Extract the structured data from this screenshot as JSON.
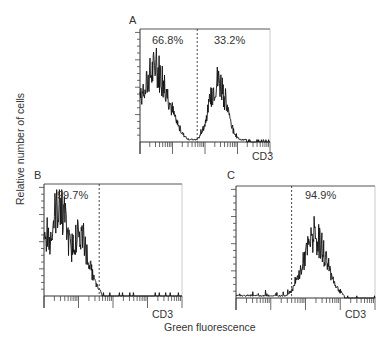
{
  "figure": {
    "y_axis_label": "Relative number of cells",
    "x_axis_label": "Green fluorescence"
  },
  "chart_data": [
    {
      "type": "area",
      "panel": "A",
      "title": "A",
      "xlabel": "CD3",
      "ylabel": "Relative number of cells",
      "x_scale": "log",
      "x_decades": 4,
      "gate_position_fraction": 0.44,
      "annotations": [
        "66.8%",
        "33.2%"
      ],
      "gate_regions": [
        {
          "label": "left of gate",
          "percent": 66.8
        },
        {
          "label": "right of gate",
          "percent": 33.2
        }
      ],
      "distribution": "bimodal",
      "peaks": [
        {
          "x_fraction": 0.12,
          "relative_height": 0.64
        },
        {
          "x_fraction": 0.6,
          "relative_height": 0.54
        }
      ],
      "grid": false
    },
    {
      "type": "area",
      "panel": "B",
      "title": "B",
      "xlabel": "CD3",
      "ylabel": "Relative number of cells",
      "x_scale": "log",
      "x_decades": 4,
      "gate_position_fraction": 0.4,
      "annotations": [
        "99.7%"
      ],
      "gate_regions": [
        {
          "label": "left of gate",
          "percent": 99.7
        }
      ],
      "distribution": "unimodal-low",
      "peaks": [
        {
          "x_fraction": 0.11,
          "relative_height": 0.81
        },
        {
          "x_fraction": 0.25,
          "relative_height": 0.55
        }
      ],
      "grid": false
    },
    {
      "type": "area",
      "panel": "C",
      "title": "C",
      "xlabel": "CD3",
      "ylabel": "Relative number of cells",
      "x_scale": "log",
      "x_decades": 4,
      "gate_position_fraction": 0.4,
      "annotations": [
        "94.9%"
      ],
      "gate_regions": [
        {
          "label": "right of gate",
          "percent": 94.9
        }
      ],
      "distribution": "unimodal-high",
      "peaks": [
        {
          "x_fraction": 0.57,
          "relative_height": 0.53
        }
      ],
      "grid": false
    }
  ]
}
